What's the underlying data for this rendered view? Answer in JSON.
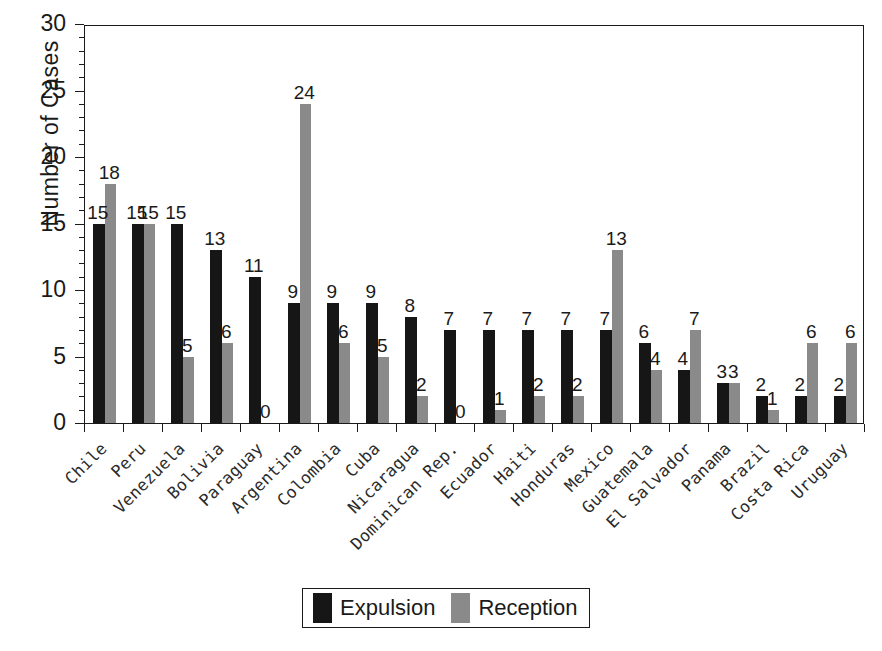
{
  "chart_data": {
    "type": "bar",
    "title": "",
    "xlabel": "",
    "ylabel": "Number of Cases",
    "ylim": [
      0,
      30
    ],
    "yticks": [
      0,
      5,
      10,
      15,
      20,
      25,
      30
    ],
    "minor_tick_interval": 1,
    "grid": false,
    "legend_position": "bottom-center",
    "categories": [
      "Chile",
      "Peru",
      "Venezuela",
      "Bolivia",
      "Paraguay",
      "Argentina",
      "Colombia",
      "Cuba",
      "Nicaragua",
      "Dominican Rep.",
      "Ecuador",
      "Haiti",
      "Honduras",
      "Mexico",
      "Guatemala",
      "El Salvador",
      "Panama",
      "Brazil",
      "Costa Rica",
      "Uruguay"
    ],
    "series": [
      {
        "name": "Expulsion",
        "color": "#161616",
        "values": [
          15,
          15,
          15,
          13,
          11,
          9,
          9,
          9,
          8,
          7,
          7,
          7,
          7,
          7,
          6,
          4,
          3,
          2,
          2,
          2
        ]
      },
      {
        "name": "Reception",
        "color": "#8a8a8a",
        "values": [
          18,
          15,
          5,
          6,
          0,
          24,
          6,
          5,
          2,
          0,
          1,
          2,
          2,
          13,
          4,
          7,
          3,
          1,
          6,
          6
        ]
      }
    ]
  },
  "legend": {
    "entries": [
      {
        "label": "Expulsion",
        "color": "#161616"
      },
      {
        "label": "Reception",
        "color": "#8a8a8a"
      }
    ]
  }
}
